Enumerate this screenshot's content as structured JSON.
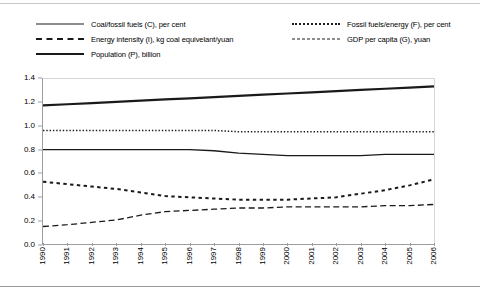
{
  "chart_data": {
    "type": "line",
    "title": "",
    "subtitle": "",
    "xlabel": "",
    "ylabel": "",
    "xlim": [
      1990,
      2006
    ],
    "ylim": [
      0.0,
      1.4
    ],
    "yticks": [
      "0.0",
      "0.2",
      "0.4",
      "0.6",
      "0.8",
      "1.0",
      "1.2",
      "1.4"
    ],
    "grid": false,
    "legend_position": "top",
    "categories": [
      "1990",
      "1991",
      "1992",
      "1993",
      "1994",
      "1995",
      "1996",
      "1997",
      "1998",
      "1999",
      "2000",
      "2001",
      "2002",
      "2003",
      "2004",
      "2005",
      "2006"
    ],
    "series": [
      {
        "name": "Coal/fossil fuels (C), per cent",
        "style": "solid-thin",
        "color": "#1a1a1a",
        "values": [
          0.8,
          0.8,
          0.8,
          0.8,
          0.8,
          0.8,
          0.8,
          0.79,
          0.77,
          0.76,
          0.75,
          0.75,
          0.75,
          0.75,
          0.76,
          0.76,
          0.76
        ]
      },
      {
        "name": "Fossil fuels/energy (F), per cent",
        "style": "dotted",
        "color": "#1a1a1a",
        "values": [
          0.96,
          0.96,
          0.96,
          0.96,
          0.96,
          0.96,
          0.96,
          0.96,
          0.95,
          0.95,
          0.95,
          0.95,
          0.95,
          0.95,
          0.95,
          0.95,
          0.95
        ]
      },
      {
        "name": "Energy intensity (I), kg coal equivelant/yuan",
        "style": "dash-square",
        "color": "#1a1a1a",
        "values": [
          0.53,
          0.51,
          0.49,
          0.47,
          0.44,
          0.41,
          0.4,
          0.39,
          0.38,
          0.38,
          0.38,
          0.39,
          0.4,
          0.43,
          0.46,
          0.5,
          0.55
        ]
      },
      {
        "name": "GDP per capita (G), yuan",
        "style": "dash-long",
        "color": "#1a1a1a",
        "values": [
          0.155,
          0.17,
          0.19,
          0.21,
          0.25,
          0.28,
          0.29,
          0.3,
          0.31,
          0.31,
          0.32,
          0.32,
          0.32,
          0.32,
          0.33,
          0.33,
          0.34
        ]
      },
      {
        "name": "Population (P), billion",
        "style": "solid-thick",
        "color": "#1a1a1a",
        "values": [
          1.17,
          1.18,
          1.19,
          1.2,
          1.21,
          1.22,
          1.23,
          1.24,
          1.25,
          1.26,
          1.27,
          1.28,
          1.29,
          1.3,
          1.31,
          1.32,
          1.33
        ]
      }
    ]
  },
  "legend": {
    "columns": [
      {
        "items": [
          {
            "label": "Coal/fossil fuels (C), per cent",
            "style": "solid-thin"
          },
          {
            "label": "Energy intensity (I), kg coal equivelant/yuan",
            "style": "dash-square"
          },
          {
            "label": "Population (P), billion",
            "style": "solid-thick"
          }
        ]
      },
      {
        "items": [
          {
            "label": "Fossil fuels/energy (F), per cent",
            "style": "dotted"
          },
          {
            "label": "GDP per capita (G), yuan",
            "style": "dash-long"
          }
        ]
      }
    ]
  }
}
